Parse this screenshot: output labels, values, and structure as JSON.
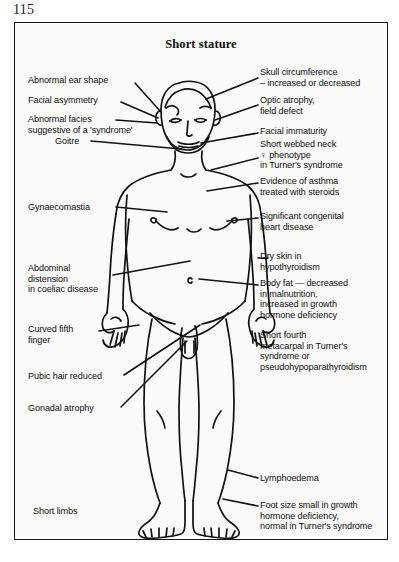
{
  "page": {
    "number": "115"
  },
  "figure": {
    "title": "Short stature",
    "labels": {
      "abnormal_ear_shape": "Abnormal ear shape",
      "facial_asymmetry": "Facial asymmetry",
      "abnormal_facies": "Abnormal facies\nsuggestive of a 'syndrome'",
      "goitre": "Goitre",
      "gynaecomastia": "Gynaecomastia",
      "abdominal_distension": "Abdominal\ndistension\nin coeliac disease",
      "curved_fifth_finger": "Curved fifth\nfinger",
      "pubic_hair_reduced": "Pubic hair reduced",
      "gonadal_atrophy": "Gonadal atrophy",
      "short_limbs": "Short limbs",
      "skull_circumference": "Skull circumference\n– increased or decreased",
      "optic_atrophy": "Optic atrophy,\nfield defect",
      "facial_immaturity": "Facial immaturity",
      "short_webbed_neck": "Short webbed neck\n♀ phenotype\nin Turner's syndrome",
      "evidence_of_asthma": "Evidence of asthma\ntreated with steroids",
      "significant_congenital_heart_disease": "Significant congenital\nheart disease",
      "dry_skin": "Dry skin in\nhypothyroidism",
      "body_fat": "Body fat — decreased\nin malnutrition,\nincreased in growth\nhormone deficiency",
      "short_fourth_metacarpal": "Short fourth\nmetacarpal in Turner's\nsyndrome or\npseudohypoparathyroidism",
      "lymphoedema": "Lymphoedema",
      "foot_size": "Foot size small in growth\nhormone deficiency,\nnormal in Turner's syndrome"
    }
  }
}
